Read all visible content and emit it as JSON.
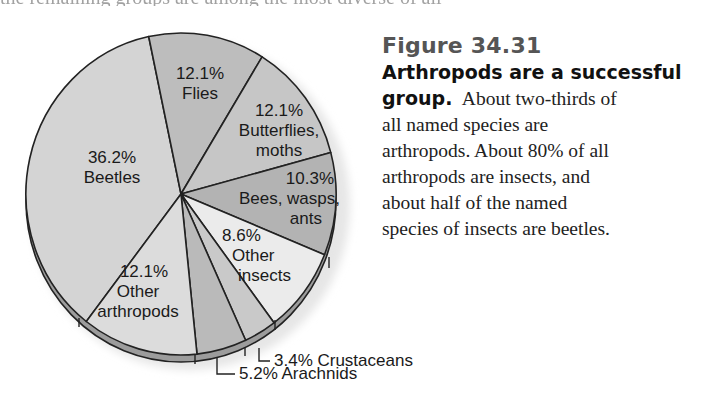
{
  "page": {
    "top_cut_text": "the remaining groups are among the most diverse of all"
  },
  "figure": {
    "number": "Figure 34.31",
    "title_line1": "Arthropods are a successful",
    "title_line2": "group.",
    "body_line2": "About two-thirds of",
    "body_lines": [
      "all named species are",
      "arthropods. About 80% of all",
      "arthropods are insects, and",
      "about half of the named",
      "species of insects are beetles."
    ]
  },
  "colors": {
    "beetles": "#d4d4d4",
    "flies": "#bdbdbd",
    "butterflies": "#c6c6c6",
    "bees": "#b3b3b3",
    "other_insects": "#ebebeb",
    "crustaceans": "#c9c9c9",
    "arachnids": "#bababa",
    "other_arthropods": "#dcdcdc",
    "outline": "#222222",
    "rim": "#9c9c9c"
  },
  "chart_data": {
    "type": "pie",
    "title": "Figure 34.31 Arthropods are a successful group.",
    "categories": [
      "Beetles",
      "Flies",
      "Butterflies, moths",
      "Bees, wasps, ants",
      "Other insects",
      "Crustaceans",
      "Arachnids",
      "Other arthropods"
    ],
    "values": [
      36.2,
      12.1,
      12.1,
      10.3,
      8.6,
      3.4,
      5.2,
      12.1
    ],
    "unit": "%",
    "labels": [
      {
        "pct": "36.2%",
        "name": "Beetles"
      },
      {
        "pct": "12.1%",
        "name": "Flies"
      },
      {
        "pct": "12.1%",
        "name_line1": "Butterflies,",
        "name_line2": "moths"
      },
      {
        "pct": "10.3%",
        "name_line1": "Bees, wasps,",
        "name_line2": "ants"
      },
      {
        "pct": "8.6%",
        "name_line1": "Other",
        "name_line2": "insects"
      },
      {
        "callout": "3.4% Crustaceans"
      },
      {
        "callout": "5.2% Arachnids"
      },
      {
        "pct": "12.1%",
        "name_line1": "Other",
        "name_line2": "arthropods"
      }
    ],
    "style": "3D tilted pie, grayscale, labels inside slices, callouts for small slices",
    "legend": "none"
  }
}
